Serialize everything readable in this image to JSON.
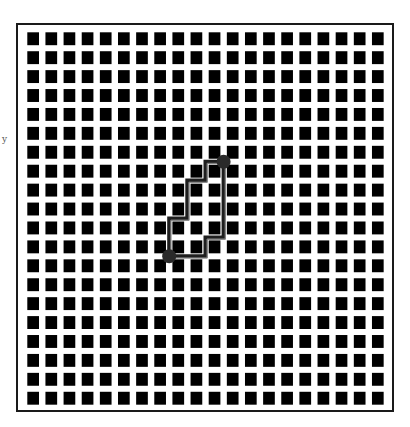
{
  "figure": {
    "type": "grid-maze-path",
    "side_glyph": "y",
    "frame": {
      "x": 17,
      "y": 24,
      "width": 376,
      "height": 387,
      "stroke": "#1a1a1a",
      "stroke_width": 2
    },
    "grid": {
      "rows": 20,
      "cols": 20,
      "origin_x": 27.3,
      "origin_y": 32.3,
      "pitch_x": 18.14,
      "pitch_y": 18.92,
      "cell_width": 11.7,
      "cell_height": 12.9,
      "fill": "#000000"
    },
    "colors": {
      "background": "#ffffff",
      "path_dark": "#1e1e1e",
      "path_light": "#8a8a8a",
      "endpoint": "#2a2a2a"
    },
    "endpoints": [
      {
        "name": "start",
        "x": 169.2,
        "y": 256.3,
        "r": 7
      },
      {
        "name": "end",
        "x": 223.6,
        "y": 161.7,
        "r": 7
      }
    ],
    "paths": [
      {
        "name": "left-staircase-path",
        "points": [
          [
            169.2,
            256.3
          ],
          [
            169.2,
            218.5
          ],
          [
            187.3,
            218.5
          ],
          [
            187.3,
            180.6
          ],
          [
            205.5,
            180.6
          ],
          [
            205.5,
            161.7
          ],
          [
            223.6,
            161.7
          ]
        ]
      },
      {
        "name": "right-staircase-path",
        "points": [
          [
            223.6,
            161.7
          ],
          [
            223.6,
            237.4
          ],
          [
            205.5,
            237.4
          ],
          [
            205.5,
            256.3
          ],
          [
            169.2,
            256.3
          ]
        ]
      }
    ]
  }
}
